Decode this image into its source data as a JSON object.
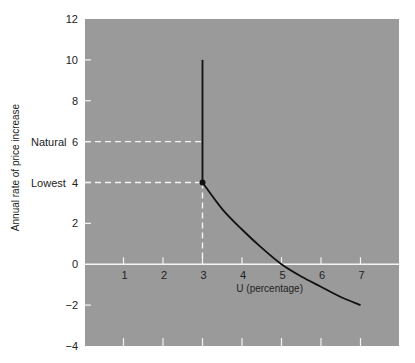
{
  "chart_data": {
    "type": "line",
    "title": "",
    "xlabel": "U (percentage)",
    "ylabel": "Annual rate of price increase",
    "xlim": [
      0,
      8
    ],
    "ylim": [
      -4,
      12
    ],
    "x_ticks": [
      1,
      2,
      3,
      4,
      5,
      6,
      7
    ],
    "y_ticks": [
      -4,
      -2,
      0,
      2,
      4,
      6,
      8,
      10,
      12
    ],
    "y_tick_labels": [
      "−4",
      "−2",
      "0",
      "2",
      "4",
      "6",
      "8",
      "10",
      "12"
    ],
    "grid": false,
    "background_color": "#9a9a9a",
    "series": [
      {
        "name": "Vertical segment",
        "points": [
          [
            3,
            10
          ],
          [
            3,
            4
          ]
        ]
      },
      {
        "name": "Phillips curve",
        "points": [
          [
            3,
            4
          ],
          [
            3.5,
            2.7
          ],
          [
            4,
            1.7
          ],
          [
            4.5,
            0.8
          ],
          [
            5,
            0
          ],
          [
            5.5,
            -0.6
          ],
          [
            6,
            -1.1
          ],
          [
            6.5,
            -1.6
          ],
          [
            7,
            -2
          ]
        ]
      }
    ],
    "marker": {
      "label": "kink",
      "point": [
        3,
        4
      ]
    },
    "annotations": [
      {
        "text": "Natural",
        "y": 6,
        "dashed_to_x": 3
      },
      {
        "text": "Lowest",
        "y": 4,
        "dashed_to_x": 3,
        "dashed_down_to_y": 0
      }
    ]
  }
}
